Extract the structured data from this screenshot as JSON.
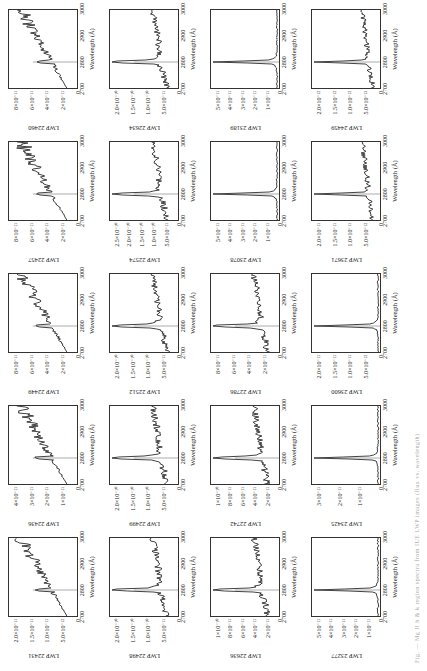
{
  "figure": {
    "xlabel": "Wavelength (Å)",
    "xticks": [
      "2700",
      "2800",
      "2900",
      "3000"
    ],
    "caption": "Fig. — Mg II h & k region spectra from IUE LWP images (flux vs. wavelength)"
  },
  "chart_data": [
    {
      "type": "line",
      "title": "LWP 22431",
      "xlabel": "Wavelength (Å)",
      "xlim": [
        2700,
        3000
      ],
      "yticks": [
        "0",
        "5.0×10⁻¹²",
        "1.0×10⁻¹¹",
        "1.5×10⁻¹¹",
        "2.0×10⁻¹¹"
      ],
      "profile": "noisy"
    },
    {
      "type": "line",
      "title": "LWP 22436",
      "xlabel": "Wavelength (Å)",
      "xlim": [
        2700,
        3000
      ],
      "yticks": [
        "0",
        "1×10⁻¹¹",
        "2×10⁻¹¹",
        "3×10⁻¹¹",
        "4×10⁻¹¹"
      ],
      "profile": "noisy"
    },
    {
      "type": "line",
      "title": "LWP 22449",
      "xlabel": "Wavelength (Å)",
      "xlim": [
        2700,
        3000
      ],
      "yticks": [
        "0",
        "2×10⁻¹¹",
        "4×10⁻¹¹",
        "6×10⁻¹¹",
        "8×10⁻¹¹"
      ],
      "profile": "noisy"
    },
    {
      "type": "line",
      "title": "LWP 22457",
      "xlabel": "Wavelength (Å)",
      "xlim": [
        2700,
        3000
      ],
      "yticks": [
        "0",
        "2×10⁻¹¹",
        "4×10⁻¹¹",
        "6×10⁻¹¹",
        "8×10⁻¹¹"
      ],
      "profile": "noisy"
    },
    {
      "type": "line",
      "title": "LWP 22460",
      "xlabel": "Wavelength (Å)",
      "xlim": [
        2700,
        3000
      ],
      "yticks": [
        "0",
        "2×10⁻¹¹",
        "4×10⁻¹¹",
        "6×10⁻¹¹",
        "8×10⁻¹¹"
      ],
      "profile": "noisy"
    },
    {
      "type": "line",
      "title": "LWP 22498",
      "xlabel": "Wavelength (Å)",
      "xlim": [
        2700,
        3000
      ],
      "yticks": [
        "0",
        "5.0×10⁻¹¹",
        "1.0×10⁻¹⁰",
        "1.5×10⁻¹⁰",
        "2.0×10⁻¹⁰"
      ],
      "profile": "peak"
    },
    {
      "type": "line",
      "title": "LWP 22499",
      "xlabel": "Wavelength (Å)",
      "xlim": [
        2700,
        3000
      ],
      "yticks": [
        "0",
        "5.0×10⁻¹¹",
        "1.0×10⁻¹⁰",
        "1.5×10⁻¹⁰",
        "2.0×10⁻¹⁰"
      ],
      "profile": "peak"
    },
    {
      "type": "line",
      "title": "LWP 22512",
      "xlabel": "Wavelength (Å)",
      "xlim": [
        2700,
        3000
      ],
      "yticks": [
        "0",
        "5.0×10⁻¹¹",
        "1.0×10⁻¹⁰",
        "1.5×10⁻¹⁰",
        "2.0×10⁻¹⁰"
      ],
      "profile": "peak"
    },
    {
      "type": "line",
      "title": "LWP 22574",
      "xlabel": "Wavelength (Å)",
      "xlim": [
        2700,
        3000
      ],
      "yticks": [
        "0",
        "5.0×10⁻¹¹",
        "1.0×10⁻¹⁰",
        "1.5×10⁻¹⁰",
        "2.0×10⁻¹⁰",
        "2.5×10⁻¹⁰"
      ],
      "profile": "peak"
    },
    {
      "type": "line",
      "title": "LWP 22634",
      "xlabel": "Wavelength (Å)",
      "xlim": [
        2700,
        3000
      ],
      "yticks": [
        "0",
        "5.0×10⁻¹¹",
        "1.0×10⁻¹⁰",
        "1.5×10⁻¹⁰",
        "2.0×10⁻¹⁰"
      ],
      "profile": "peak"
    },
    {
      "type": "line",
      "title": "LWP 22636",
      "xlabel": "Wavelength (Å)",
      "xlim": [
        2700,
        3000
      ],
      "yticks": [
        "0",
        "2×10⁻¹¹",
        "4×10⁻¹¹",
        "6×10⁻¹¹",
        "8×10⁻¹¹",
        "1×10⁻¹⁰"
      ],
      "profile": "peak"
    },
    {
      "type": "line",
      "title": "LWP 22742",
      "xlabel": "Wavelength (Å)",
      "xlim": [
        2700,
        3000
      ],
      "yticks": [
        "0",
        "2×10⁻¹¹",
        "4×10⁻¹¹",
        "6×10⁻¹¹",
        "8×10⁻¹¹",
        "1×10⁻¹⁰"
      ],
      "profile": "peak"
    },
    {
      "type": "line",
      "title": "LWP 22786",
      "xlabel": "Wavelength (Å)",
      "xlim": [
        2700,
        3000
      ],
      "yticks": [
        "0",
        "2×10⁻¹¹",
        "4×10⁻¹¹",
        "6×10⁻¹¹",
        "8×10⁻¹¹"
      ],
      "profile": "peak"
    },
    {
      "type": "line",
      "title": "LWP 23078",
      "xlabel": "Wavelength (Å)",
      "xlim": [
        2700,
        3000
      ],
      "yticks": [
        "0",
        "1×10⁻¹¹",
        "2×10⁻¹¹",
        "3×10⁻¹¹",
        "4×10⁻¹¹",
        "5×10⁻¹¹"
      ],
      "profile": "sharp"
    },
    {
      "type": "line",
      "title": "LWP 23189",
      "xlabel": "Wavelength (Å)",
      "xlim": [
        2700,
        3000
      ],
      "yticks": [
        "0",
        "1×10⁻¹¹",
        "2×10⁻¹¹",
        "3×10⁻¹¹",
        "4×10⁻¹¹",
        "5×10⁻¹¹"
      ],
      "profile": "sharp"
    },
    {
      "type": "line",
      "title": "LWP 23277",
      "xlabel": "Wavelength (Å)",
      "xlim": [
        2700,
        3000
      ],
      "yticks": [
        "0",
        "1×10⁻¹¹",
        "2×10⁻¹¹",
        "3×10⁻¹¹",
        "4×10⁻¹¹",
        "5×10⁻¹¹"
      ],
      "profile": "sharp"
    },
    {
      "type": "line",
      "title": "LWP 23425",
      "xlabel": "Wavelength (Å)",
      "xlim": [
        2700,
        3000
      ],
      "yticks": [
        "0",
        "1×10⁻¹¹",
        "2×10⁻¹¹",
        "3×10⁻¹¹"
      ],
      "profile": "sharp"
    },
    {
      "type": "line",
      "title": "LWP 23600",
      "xlabel": "Wavelength (Å)",
      "xlim": [
        2700,
        3000
      ],
      "yticks": [
        "0",
        "5.0×10⁻¹²",
        "1.0×10⁻¹¹",
        "1.5×10⁻¹¹",
        "2.0×10⁻¹¹"
      ],
      "profile": "sharp"
    },
    {
      "type": "line",
      "title": "LWP 23671",
      "xlabel": "Wavelength (Å)",
      "xlim": [
        2700,
        3000
      ],
      "yticks": [
        "0",
        "5.0×10⁻¹²",
        "1.0×10⁻¹¹",
        "1.5×10⁻¹¹",
        "2.0×10⁻¹¹"
      ],
      "profile": "sharpnoisy"
    },
    {
      "type": "line",
      "title": "LWP 24459",
      "xlabel": "Wavelength (Å)",
      "xlim": [
        2700,
        3000
      ],
      "yticks": [
        "0",
        "5.0×10⁻¹³",
        "1.0×10⁻¹²",
        "1.5×10⁻¹²",
        "2.0×10⁻¹²"
      ],
      "profile": "sharpnoisy"
    }
  ]
}
